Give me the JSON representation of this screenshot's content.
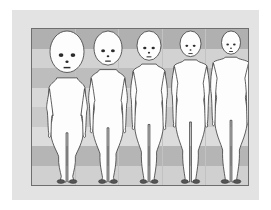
{
  "illustration": {
    "title": "Changes in human body proportions during growth",
    "subject": "human-figure-proportion-series",
    "figure_count": 5,
    "orientation": "front-view standing, arms at sides",
    "normalization": "all five figures drawn to the same total height"
  },
  "panel": {
    "outer_background_color": "#e3e3e3",
    "plate_background_color": "#d8d8d8",
    "plate_border_color": "#6e6e6e",
    "band_dark_color": "#b0b0b0",
    "band_mid_color": "#c8c8c8",
    "band_light_color": "#dcdcdc",
    "gridline_color": "#c2c2c2"
  },
  "body_style": {
    "fill_color": "#fdfdfd",
    "outline_color": "#3a3a3a",
    "shadow_color": "#d6d6d6",
    "feature_color": "#2b2b2b",
    "foot_color": "#555555"
  },
  "grid": {
    "type": "horizontal proportional bands (head-height divisions)",
    "band_count": 8,
    "vertical_divider_count": 4
  },
  "figures": [
    {
      "index": 1,
      "stage_label": "newborn",
      "head_to_height_ratio": "1:4",
      "head_width_px": 34,
      "shoulder_width_px": 36,
      "body_x": 8,
      "body_scale": 1.0
    },
    {
      "index": 2,
      "stage_label": "toddler",
      "head_to_height_ratio": "1:5",
      "head_width_px": 28,
      "shoulder_width_px": 34,
      "body_x": 50,
      "body_scale": 1.0
    },
    {
      "index": 3,
      "stage_label": "child",
      "head_to_height_ratio": "1:6",
      "head_width_px": 24,
      "shoulder_width_px": 32,
      "body_x": 92,
      "body_scale": 1.0
    },
    {
      "index": 4,
      "stage_label": "adolescent",
      "head_to_height_ratio": "1:7",
      "head_width_px": 21,
      "shoulder_width_px": 33,
      "body_x": 133,
      "body_scale": 1.0
    },
    {
      "index": 5,
      "stage_label": "adult",
      "head_to_height_ratio": "1:8",
      "head_width_px": 19,
      "shoulder_width_px": 36,
      "body_x": 172,
      "body_scale": 1.0
    }
  ],
  "bands": [
    {
      "top_pct": 0,
      "height_pct": 12.5,
      "color": "#b0b0b0"
    },
    {
      "top_pct": 12.5,
      "height_pct": 12.5,
      "color": "#d2d2d2"
    },
    {
      "top_pct": 25,
      "height_pct": 12.5,
      "color": "#bdbdbd"
    },
    {
      "top_pct": 37.5,
      "height_pct": 12.5,
      "color": "#d8d8d8"
    },
    {
      "top_pct": 50,
      "height_pct": 12.5,
      "color": "#cacaca"
    },
    {
      "top_pct": 62.5,
      "height_pct": 12.5,
      "color": "#dcdcdc"
    },
    {
      "top_pct": 75,
      "height_pct": 12.5,
      "color": "#b5b5b5"
    },
    {
      "top_pct": 87.5,
      "height_pct": 12.5,
      "color": "#d0d0d0"
    }
  ],
  "vertical_dividers": [
    {
      "left_pct": 20
    },
    {
      "left_pct": 40
    },
    {
      "left_pct": 60
    },
    {
      "left_pct": 80
    }
  ]
}
